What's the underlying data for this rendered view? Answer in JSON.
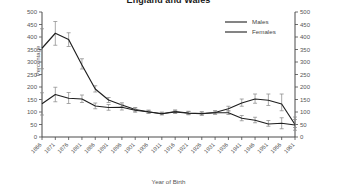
{
  "title": "England and Wales",
  "axes": {
    "ylabel": "Percentage",
    "xlabel": "Year of Birth"
  },
  "legend": {
    "males": "Males",
    "females": "Females"
  },
  "chart_data": {
    "type": "line",
    "title": "England and Wales",
    "xlabel": "Year of Birth",
    "ylabel": "Percentage",
    "ylim": [
      0,
      500
    ],
    "ytick_step": 50,
    "yticks": [
      0,
      50,
      100,
      150,
      200,
      250,
      300,
      350,
      400,
      450,
      500
    ],
    "right_axis_yticks": [
      0,
      50,
      100,
      150,
      200,
      250,
      300,
      350,
      400,
      450,
      500
    ],
    "grid": false,
    "legend_position": "top-right",
    "error_bars": true,
    "categories": [
      1866,
      1871,
      1876,
      1881,
      1886,
      1891,
      1896,
      1901,
      1906,
      1911,
      1916,
      1921,
      1926,
      1931,
      1936,
      1941,
      1946,
      1951,
      1956,
      1961
    ],
    "series": [
      {
        "name": "Males",
        "values": [
          355,
          415,
          390,
          288,
          192,
          148,
          128,
          110,
          101,
          93,
          102,
          96,
          94,
          98,
          113,
          136,
          152,
          147,
          132,
          50
        ],
        "err_low": [
          273,
          367,
          362,
          272,
          180,
          138,
          120,
          103,
          96,
          89,
          96,
          90,
          88,
          92,
          104,
          123,
          135,
          126,
          105,
          38
        ],
        "err_high": [
          433,
          462,
          417,
          313,
          205,
          158,
          137,
          118,
          107,
          99,
          108,
          103,
          101,
          105,
          123,
          152,
          172,
          172,
          172,
          80
        ]
      },
      {
        "name": "Females",
        "values": [
          133,
          170,
          155,
          152,
          124,
          118,
          119,
          107,
          100,
          93,
          100,
          95,
          93,
          97,
          97,
          75,
          67,
          52,
          55,
          48
        ],
        "err_low": [
          88,
          141,
          134,
          138,
          113,
          107,
          108,
          99,
          94,
          89,
          94,
          89,
          87,
          91,
          90,
          65,
          57,
          43,
          33,
          27
        ],
        "err_high": [
          177,
          199,
          178,
          168,
          136,
          130,
          131,
          116,
          107,
          99,
          107,
          102,
          100,
          104,
          105,
          86,
          79,
          66,
          77,
          70
        ]
      }
    ]
  }
}
